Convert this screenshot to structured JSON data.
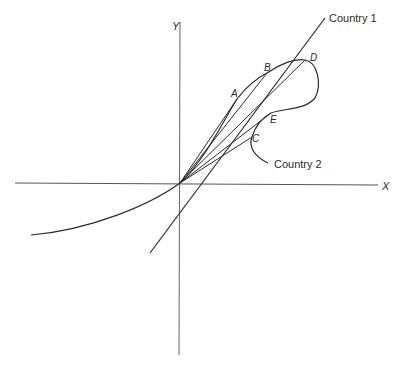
{
  "diagram": {
    "axes": {
      "x_label": "X",
      "y_label": "Y"
    },
    "curves": {
      "country1_label": "Country 1",
      "country2_label": "Country 2"
    },
    "points": {
      "A": "A",
      "B": "B",
      "C": "C",
      "D": "D",
      "E": "E"
    },
    "colors": {
      "ink": "#2a2a2a",
      "axis": "#555555",
      "background": "#ffffff"
    }
  }
}
